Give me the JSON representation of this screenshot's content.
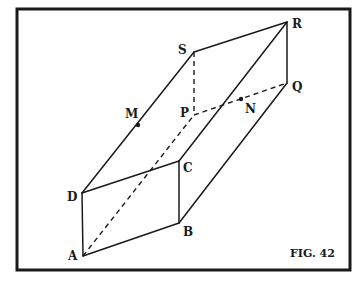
{
  "figure": {
    "caption": "FIG. 42"
  },
  "vertices": {
    "A": {
      "label": "A",
      "x": 83,
      "y": 256
    },
    "B": {
      "label": "B",
      "x": 179,
      "y": 223
    },
    "C": {
      "label": "C",
      "x": 179,
      "y": 161
    },
    "D": {
      "label": "D",
      "x": 82,
      "y": 193
    },
    "P": {
      "label": "P",
      "x": 194,
      "y": 115
    },
    "Q": {
      "label": "Q",
      "x": 287,
      "y": 83
    },
    "R": {
      "label": "R",
      "x": 287,
      "y": 22
    },
    "S": {
      "label": "S",
      "x": 194,
      "y": 52
    }
  },
  "points": {
    "M": {
      "label": "M",
      "x": 138,
      "y": 125
    },
    "N": {
      "label": "N",
      "x": 241,
      "y": 99
    }
  },
  "edges_solid": [
    "AB",
    "BC",
    "CD",
    "DA",
    "DS",
    "SR",
    "RQ",
    "QB",
    "CR"
  ],
  "edges_dashed": [
    "SP",
    "PQ",
    "AP"
  ],
  "colors": {
    "ink": "#1a1a1a",
    "background": "#ffffff"
  }
}
